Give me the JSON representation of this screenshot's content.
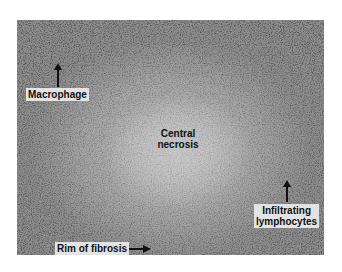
{
  "figure": {
    "labels": {
      "macrophage": "Macrophage",
      "central_necrosis_line1": "Central",
      "central_necrosis_line2": "necrosis",
      "infiltrating_line1": "Infiltrating",
      "infiltrating_line2": "lymphocytes",
      "rim_of_fibrosis": "Rim of fibrosis"
    },
    "arrows": {
      "macrophage": "up",
      "infiltrating_lymphocytes": "up",
      "rim_of_fibrosis": "right"
    }
  }
}
